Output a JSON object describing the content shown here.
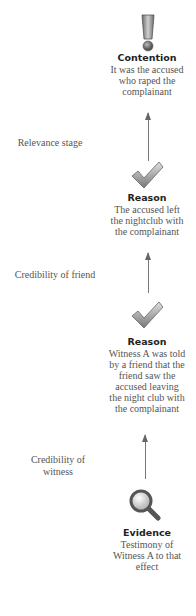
{
  "diagram": {
    "nodes": [
      {
        "type": "Contention",
        "icon": "exclamation-icon",
        "title": "Contention",
        "lines": [
          "It was the accused",
          "who raped the",
          "complainant"
        ]
      },
      {
        "type": "Reason",
        "icon": "checkmark-icon",
        "title": "Reason",
        "lines": [
          "The accused left",
          "the nightclub with",
          "the complainant"
        ]
      },
      {
        "type": "Reason",
        "icon": "checkmark-icon",
        "title": "Reason",
        "lines": [
          "Witness A was told",
          "by a friend that the",
          "friend saw the",
          "accused leaving",
          "the night club with",
          "the complainant"
        ]
      },
      {
        "type": "Evidence",
        "icon": "magnifier-icon",
        "title": "Evidence",
        "lines": [
          "Testimony of",
          "Witness A to that",
          "effect"
        ]
      }
    ],
    "stages": [
      {
        "lines": [
          "Relevance stage"
        ]
      },
      {
        "lines": [
          "Credibility of friend"
        ]
      },
      {
        "lines": [
          "Credibility of",
          "witness"
        ]
      }
    ],
    "colors": {
      "arrow": "#777777",
      "title": "#222222",
      "body": "#555555",
      "icon": "#8a8a8a"
    }
  }
}
